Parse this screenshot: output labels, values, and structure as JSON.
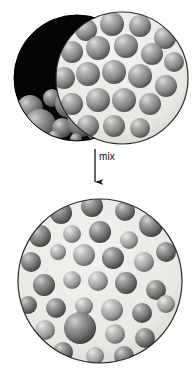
{
  "figure": {
    "background_color": "#ffffff",
    "width": 195,
    "height": 380,
    "arrow": {
      "label": "mix",
      "direction": "down",
      "color": "#1a1a1a",
      "x": 95,
      "y_start": 149,
      "y_end": 184
    },
    "panels": [
      {
        "id": "source-dark",
        "name": "dark-particle-sample",
        "shape": "circle",
        "cx": 77,
        "cy": 78,
        "r": 63,
        "background_color": "#050505",
        "border_color": "#000000",
        "particle_fill": "#7e7e7e",
        "particle_highlight": "#c9c9c9",
        "particle_shadow": "#3a3a3a",
        "particles": [
          {
            "cx": 30,
            "cy": 108,
            "r": 13
          },
          {
            "cx": 52,
            "cy": 98,
            "r": 9
          },
          {
            "cx": 69,
            "cy": 104,
            "r": 14
          },
          {
            "cx": 40,
            "cy": 125,
            "r": 16
          },
          {
            "cx": 62,
            "cy": 128,
            "r": 10
          },
          {
            "cx": 82,
            "cy": 122,
            "r": 15
          },
          {
            "cx": 24,
            "cy": 132,
            "r": 8
          },
          {
            "cx": 96,
            "cy": 132,
            "r": 9
          },
          {
            "cx": 55,
            "cy": 137,
            "r": 7
          },
          {
            "cx": 76,
            "cy": 139,
            "r": 6
          }
        ]
      },
      {
        "id": "source-light",
        "name": "light-particle-sample",
        "shape": "circle",
        "cx": 122,
        "cy": 78,
        "r": 66,
        "background_color": "#e9e9e7",
        "border_color": "#2b2b2b",
        "particle_fill": "#8d8d8d",
        "particle_highlight": "#d5d5d5",
        "particle_shadow": "#4b4b4b",
        "particles": [
          {
            "cx": 86,
            "cy": 30,
            "r": 11
          },
          {
            "cx": 112,
            "cy": 24,
            "r": 12
          },
          {
            "cx": 140,
            "cy": 26,
            "r": 11
          },
          {
            "cx": 165,
            "cy": 38,
            "r": 11
          },
          {
            "cx": 72,
            "cy": 52,
            "r": 11
          },
          {
            "cx": 98,
            "cy": 48,
            "r": 12
          },
          {
            "cx": 126,
            "cy": 46,
            "r": 12
          },
          {
            "cx": 152,
            "cy": 54,
            "r": 11
          },
          {
            "cx": 174,
            "cy": 62,
            "r": 10
          },
          {
            "cx": 64,
            "cy": 78,
            "r": 11
          },
          {
            "cx": 88,
            "cy": 74,
            "r": 12
          },
          {
            "cx": 114,
            "cy": 72,
            "r": 12
          },
          {
            "cx": 140,
            "cy": 76,
            "r": 12
          },
          {
            "cx": 166,
            "cy": 86,
            "r": 11
          },
          {
            "cx": 72,
            "cy": 104,
            "r": 11
          },
          {
            "cx": 98,
            "cy": 100,
            "r": 12
          },
          {
            "cx": 124,
            "cy": 100,
            "r": 12
          },
          {
            "cx": 150,
            "cy": 104,
            "r": 11
          },
          {
            "cx": 88,
            "cy": 126,
            "r": 11
          },
          {
            "cx": 114,
            "cy": 126,
            "r": 11
          },
          {
            "cx": 140,
            "cy": 128,
            "r": 10
          }
        ]
      },
      {
        "id": "result-mixture",
        "name": "mixed-particle-sample",
        "shape": "circle",
        "cx": 100,
        "cy": 281,
        "r": 82,
        "background_color": "#e9e9e7",
        "border_color": "#2b2b2b",
        "particle_fill_dark": "#6f6f6f",
        "particle_fill_light": "#a2a2a2",
        "particle_highlight": "#dcdcdc",
        "particle_shadow": "#3d3d3d",
        "particles": [
          {
            "cx": 61,
            "cy": 213,
            "r": 11,
            "tone": "dark"
          },
          {
            "cx": 92,
            "cy": 206,
            "r": 11,
            "tone": "dark"
          },
          {
            "cx": 125,
            "cy": 211,
            "r": 10,
            "tone": "dark"
          },
          {
            "cx": 151,
            "cy": 225,
            "r": 12,
            "tone": "dark"
          },
          {
            "cx": 40,
            "cy": 236,
            "r": 11,
            "tone": "dark"
          },
          {
            "cx": 72,
            "cy": 234,
            "r": 9,
            "tone": "light"
          },
          {
            "cx": 100,
            "cy": 232,
            "r": 11,
            "tone": "dark"
          },
          {
            "cx": 129,
            "cy": 240,
            "r": 9,
            "tone": "light"
          },
          {
            "cx": 166,
            "cy": 252,
            "r": 10,
            "tone": "dark"
          },
          {
            "cx": 31,
            "cy": 262,
            "r": 10,
            "tone": "dark"
          },
          {
            "cx": 58,
            "cy": 252,
            "r": 8,
            "tone": "light"
          },
          {
            "cx": 84,
            "cy": 255,
            "r": 11,
            "tone": "light"
          },
          {
            "cx": 113,
            "cy": 258,
            "r": 11,
            "tone": "dark"
          },
          {
            "cx": 144,
            "cy": 262,
            "r": 10,
            "tone": "light"
          },
          {
            "cx": 44,
            "cy": 285,
            "r": 11,
            "tone": "dark"
          },
          {
            "cx": 72,
            "cy": 280,
            "r": 9,
            "tone": "light"
          },
          {
            "cx": 98,
            "cy": 281,
            "r": 10,
            "tone": "light"
          },
          {
            "cx": 126,
            "cy": 283,
            "r": 11,
            "tone": "dark"
          },
          {
            "cx": 156,
            "cy": 290,
            "r": 10,
            "tone": "dark"
          },
          {
            "cx": 28,
            "cy": 305,
            "r": 9,
            "tone": "dark"
          },
          {
            "cx": 56,
            "cy": 308,
            "r": 10,
            "tone": "dark"
          },
          {
            "cx": 84,
            "cy": 306,
            "r": 9,
            "tone": "light"
          },
          {
            "cx": 112,
            "cy": 310,
            "r": 11,
            "tone": "light"
          },
          {
            "cx": 142,
            "cy": 313,
            "r": 10,
            "tone": "dark"
          },
          {
            "cx": 166,
            "cy": 304,
            "r": 9,
            "tone": "light"
          },
          {
            "cx": 45,
            "cy": 330,
            "r": 10,
            "tone": "light"
          },
          {
            "cx": 80,
            "cy": 328,
            "r": 16,
            "tone": "dark"
          },
          {
            "cx": 115,
            "cy": 334,
            "r": 10,
            "tone": "light"
          },
          {
            "cx": 145,
            "cy": 338,
            "r": 10,
            "tone": "dark"
          },
          {
            "cx": 63,
            "cy": 352,
            "r": 10,
            "tone": "dark"
          },
          {
            "cx": 95,
            "cy": 356,
            "r": 9,
            "tone": "light"
          },
          {
            "cx": 124,
            "cy": 356,
            "r": 10,
            "tone": "dark"
          }
        ]
      }
    ]
  }
}
